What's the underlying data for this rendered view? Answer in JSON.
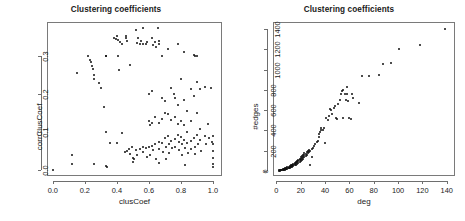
{
  "figure": {
    "background": "#ffffff",
    "point_color": "#111111",
    "axis_color": "#6e6e6e",
    "frame_color": "#7a7a7a"
  },
  "panels": [
    {
      "id": "left",
      "title": "Clustering coefficients",
      "xlabel": "clusCoef",
      "ylabel": "corrClusCoef",
      "xticks": [
        "0.0",
        "0.2",
        "0.4",
        "0.6",
        "0.8",
        "1.0"
      ],
      "yticks": [
        "0.0",
        "0.1",
        "0.2",
        "0.3"
      ]
    },
    {
      "id": "right",
      "title": "Clustering coefficients",
      "xlabel": "deg",
      "ylabel": "#edges",
      "xticks": [
        "0",
        "20",
        "40",
        "60",
        "80",
        "100",
        "120",
        "140"
      ],
      "yticks": [
        "0",
        "200",
        "400",
        "600",
        "800",
        "1000",
        "1200",
        "1400"
      ]
    }
  ],
  "chart_data": [
    {
      "type": "scatter",
      "title": "Clustering coefficients",
      "xlabel": "clusCoef",
      "ylabel": "corrClusCoef",
      "xlim": [
        -0.03,
        1.05
      ],
      "ylim": [
        -0.012,
        0.385
      ],
      "xticks": [
        0.0,
        0.2,
        0.4,
        0.6,
        0.8,
        1.0
      ],
      "yticks": [
        0.0,
        0.1,
        0.2,
        0.3
      ],
      "grid": false,
      "legend": null,
      "points": [
        [
          0.0,
          0.0
        ],
        [
          0.12,
          0.04
        ],
        [
          0.12,
          0.018
        ],
        [
          0.15,
          0.255
        ],
        [
          0.22,
          0.3
        ],
        [
          0.23,
          0.288
        ],
        [
          0.24,
          0.282
        ],
        [
          0.245,
          0.272
        ],
        [
          0.25,
          0.265
        ],
        [
          0.255,
          0.25
        ],
        [
          0.26,
          0.24
        ],
        [
          0.255,
          0.018
        ],
        [
          0.29,
          0.228
        ],
        [
          0.3,
          0.215
        ],
        [
          0.32,
          0.165
        ],
        [
          0.33,
          0.298
        ],
        [
          0.335,
          0.3
        ],
        [
          0.335,
          0.1
        ],
        [
          0.335,
          0.012
        ],
        [
          0.34,
          0.008
        ],
        [
          0.36,
          0.072
        ],
        [
          0.385,
          0.345
        ],
        [
          0.395,
          0.342
        ],
        [
          0.4,
          0.352
        ],
        [
          0.405,
          0.34
        ],
        [
          0.41,
          0.3
        ],
        [
          0.415,
          0.262
        ],
        [
          0.4,
          0.072
        ],
        [
          0.42,
          0.335
        ],
        [
          0.435,
          0.33
        ],
        [
          0.43,
          0.098
        ],
        [
          0.455,
          0.345
        ],
        [
          0.46,
          0.35
        ],
        [
          0.465,
          0.338
        ],
        [
          0.45,
          0.048
        ],
        [
          0.465,
          0.05
        ],
        [
          0.48,
          0.275
        ],
        [
          0.475,
          0.055
        ],
        [
          0.48,
          0.042
        ],
        [
          0.495,
          0.06
        ],
        [
          0.5,
          0.032
        ],
        [
          0.505,
          0.03
        ],
        [
          0.5,
          0.022
        ],
        [
          0.52,
          0.368
        ],
        [
          0.525,
          0.332
        ],
        [
          0.53,
          0.345
        ],
        [
          0.52,
          0.052
        ],
        [
          0.525,
          0.04
        ],
        [
          0.545,
          0.33
        ],
        [
          0.55,
          0.338
        ],
        [
          0.545,
          0.055
        ],
        [
          0.56,
          0.372
        ],
        [
          0.565,
          0.33
        ],
        [
          0.56,
          0.062
        ],
        [
          0.565,
          0.048
        ],
        [
          0.58,
          0.33
        ],
        [
          0.585,
          0.335
        ],
        [
          0.58,
          0.058
        ],
        [
          0.585,
          0.035
        ],
        [
          0.6,
          0.2
        ],
        [
          0.6,
          0.13
        ],
        [
          0.605,
          0.118
        ],
        [
          0.6,
          0.06
        ],
        [
          0.605,
          0.04
        ],
        [
          0.62,
          0.345
        ],
        [
          0.625,
          0.328
        ],
        [
          0.62,
          0.208
        ],
        [
          0.62,
          0.125
        ],
        [
          0.62,
          0.065
        ],
        [
          0.625,
          0.052
        ],
        [
          0.64,
          0.335
        ],
        [
          0.645,
          0.322
        ],
        [
          0.64,
          0.14
        ],
        [
          0.64,
          0.07
        ],
        [
          0.645,
          0.03
        ],
        [
          0.655,
          0.372
        ],
        [
          0.66,
          0.33
        ],
        [
          0.665,
          0.338
        ],
        [
          0.66,
          0.125
        ],
        [
          0.66,
          0.075
        ],
        [
          0.665,
          0.055
        ],
        [
          0.665,
          0.02
        ],
        [
          0.68,
          0.3
        ],
        [
          0.68,
          0.19
        ],
        [
          0.68,
          0.135
        ],
        [
          0.68,
          0.072
        ],
        [
          0.685,
          0.048
        ],
        [
          0.7,
          0.182
        ],
        [
          0.7,
          0.15
        ],
        [
          0.7,
          0.085
        ],
        [
          0.705,
          0.06
        ],
        [
          0.705,
          0.03
        ],
        [
          0.72,
          0.318
        ],
        [
          0.72,
          0.148
        ],
        [
          0.72,
          0.09
        ],
        [
          0.725,
          0.068
        ],
        [
          0.725,
          0.045
        ],
        [
          0.74,
          0.215
        ],
        [
          0.74,
          0.132
        ],
        [
          0.74,
          0.078
        ],
        [
          0.745,
          0.058
        ],
        [
          0.755,
          0.2
        ],
        [
          0.76,
          0.19
        ],
        [
          0.76,
          0.14
        ],
        [
          0.76,
          0.082
        ],
        [
          0.765,
          0.06
        ],
        [
          0.78,
          0.33
        ],
        [
          0.78,
          0.172
        ],
        [
          0.78,
          0.122
        ],
        [
          0.78,
          0.092
        ],
        [
          0.785,
          0.075
        ],
        [
          0.785,
          0.052
        ],
        [
          0.8,
          0.24
        ],
        [
          0.8,
          0.128
        ],
        [
          0.8,
          0.088
        ],
        [
          0.805,
          0.068
        ],
        [
          0.805,
          0.04
        ],
        [
          0.82,
          0.308
        ],
        [
          0.82,
          0.185
        ],
        [
          0.82,
          0.118
        ],
        [
          0.82,
          0.08
        ],
        [
          0.825,
          0.058
        ],
        [
          0.825,
          0.015
        ],
        [
          0.84,
          0.155
        ],
        [
          0.84,
          0.1
        ],
        [
          0.84,
          0.072
        ],
        [
          0.845,
          0.045
        ],
        [
          0.86,
          0.212
        ],
        [
          0.86,
          0.128
        ],
        [
          0.86,
          0.078
        ],
        [
          0.865,
          0.055
        ],
        [
          0.88,
          0.302
        ],
        [
          0.885,
          0.298
        ],
        [
          0.88,
          0.195
        ],
        [
          0.88,
          0.085
        ],
        [
          0.885,
          0.062
        ],
        [
          0.885,
          0.042
        ],
        [
          0.9,
          0.3
        ],
        [
          0.9,
          0.232
        ],
        [
          0.9,
          0.15
        ],
        [
          0.9,
          0.092
        ],
        [
          0.905,
          0.07
        ],
        [
          0.92,
          0.212
        ],
        [
          0.92,
          0.108
        ],
        [
          0.92,
          0.08
        ],
        [
          0.925,
          0.05
        ],
        [
          0.95,
          0.218
        ],
        [
          0.95,
          0.09
        ],
        [
          0.955,
          0.068
        ],
        [
          0.97,
          0.12
        ],
        [
          0.975,
          0.085
        ],
        [
          0.99,
          0.215
        ],
        [
          0.995,
          0.075
        ],
        [
          1.0,
          0.09
        ],
        [
          1.0,
          0.07
        ],
        [
          1.0,
          0.05
        ],
        [
          1.0,
          0.032
        ],
        [
          1.0,
          0.018
        ],
        [
          1.0,
          0.008
        ]
      ]
    },
    {
      "type": "scatter",
      "title": "Clustering coefficients",
      "xlabel": "deg",
      "ylabel": "#edges",
      "xlim": [
        -2,
        146
      ],
      "ylim": [
        -40,
        1460
      ],
      "xticks": [
        0,
        20,
        40,
        60,
        80,
        100,
        120,
        140
      ],
      "yticks": [
        0,
        200,
        400,
        600,
        800,
        1000,
        1200,
        1400
      ],
      "grid": false,
      "legend": null,
      "points": [
        [
          2,
          2
        ],
        [
          2,
          5
        ],
        [
          3,
          3
        ],
        [
          3,
          8
        ],
        [
          4,
          5
        ],
        [
          4,
          10
        ],
        [
          4,
          14
        ],
        [
          5,
          8
        ],
        [
          5,
          12
        ],
        [
          5,
          18
        ],
        [
          6,
          10
        ],
        [
          6,
          16
        ],
        [
          6,
          22
        ],
        [
          7,
          14
        ],
        [
          7,
          20
        ],
        [
          7,
          26
        ],
        [
          8,
          18
        ],
        [
          8,
          24
        ],
        [
          8,
          30
        ],
        [
          9,
          22
        ],
        [
          9,
          30
        ],
        [
          9,
          36
        ],
        [
          10,
          26
        ],
        [
          10,
          34
        ],
        [
          10,
          42
        ],
        [
          11,
          30
        ],
        [
          11,
          40
        ],
        [
          11,
          48
        ],
        [
          12,
          36
        ],
        [
          12,
          46
        ],
        [
          12,
          55
        ],
        [
          13,
          42
        ],
        [
          13,
          52
        ],
        [
          13,
          62
        ],
        [
          14,
          48
        ],
        [
          14,
          60
        ],
        [
          14,
          70
        ],
        [
          15,
          55
        ],
        [
          15,
          68
        ],
        [
          15,
          80
        ],
        [
          16,
          62
        ],
        [
          16,
          76
        ],
        [
          16,
          90
        ],
        [
          17,
          70
        ],
        [
          17,
          85
        ],
        [
          17,
          100
        ],
        [
          18,
          78
        ],
        [
          18,
          95
        ],
        [
          18,
          110
        ],
        [
          19,
          88
        ],
        [
          19,
          105
        ],
        [
          19,
          122
        ],
        [
          20,
          98
        ],
        [
          20,
          115
        ],
        [
          20,
          135
        ],
        [
          21,
          110
        ],
        [
          21,
          128
        ],
        [
          21,
          148
        ],
        [
          22,
          120
        ],
        [
          22,
          140
        ],
        [
          22,
          160
        ],
        [
          23,
          135
        ],
        [
          23,
          155
        ],
        [
          23,
          175
        ],
        [
          24,
          148
        ],
        [
          24,
          170
        ],
        [
          25,
          160
        ],
        [
          25,
          185
        ],
        [
          26,
          175
        ],
        [
          26,
          200
        ],
        [
          27,
          190
        ],
        [
          27,
          205
        ],
        [
          28,
          200
        ],
        [
          28,
          60
        ],
        [
          29,
          212
        ],
        [
          29,
          140
        ],
        [
          30,
          230
        ],
        [
          31,
          245
        ],
        [
          32,
          265
        ],
        [
          33,
          285
        ],
        [
          34,
          300
        ],
        [
          35,
          335
        ],
        [
          35,
          360
        ],
        [
          36,
          380
        ],
        [
          37,
          400
        ],
        [
          37,
          420
        ],
        [
          38,
          405
        ],
        [
          39,
          420
        ],
        [
          40,
          275
        ],
        [
          41,
          520
        ],
        [
          42,
          500
        ],
        [
          43,
          545
        ],
        [
          44,
          610
        ],
        [
          45,
          600
        ],
        [
          46,
          560
        ],
        [
          47,
          620
        ],
        [
          48,
          640
        ],
        [
          49,
          520
        ],
        [
          50,
          510
        ],
        [
          51,
          660
        ],
        [
          52,
          700
        ],
        [
          53,
          760
        ],
        [
          54,
          790
        ],
        [
          55,
          800
        ],
        [
          55,
          520
        ],
        [
          56,
          760
        ],
        [
          57,
          700
        ],
        [
          58,
          760
        ],
        [
          58,
          830
        ],
        [
          59,
          690
        ],
        [
          60,
          520
        ],
        [
          61,
          515
        ],
        [
          62,
          760
        ],
        [
          63,
          715
        ],
        [
          68,
          670
        ],
        [
          70,
          940
        ],
        [
          76,
          940
        ],
        [
          84,
          945
        ],
        [
          88,
          1060
        ],
        [
          94,
          1070
        ],
        [
          101,
          1205
        ],
        [
          118,
          1245
        ],
        [
          139,
          1400
        ]
      ]
    }
  ]
}
